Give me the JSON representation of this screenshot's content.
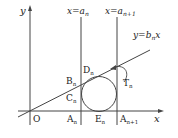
{
  "diagram": {
    "axes": {
      "x_label": "x",
      "y_label": "y",
      "origin_label": "O"
    },
    "lines": [
      {
        "label": "x=a",
        "sub": "n"
      },
      {
        "label": "x=a",
        "sub": "n+1"
      },
      {
        "label": "y=b",
        "sub": "n",
        "tail": "x"
      }
    ],
    "points": [
      {
        "name": "A",
        "sub": "n"
      },
      {
        "name": "E",
        "sub": "n"
      },
      {
        "name": "A",
        "sub": "n+1"
      },
      {
        "name": "B",
        "sub": "n"
      },
      {
        "name": "C",
        "sub": "n"
      },
      {
        "name": "D",
        "sub": "n"
      },
      {
        "name": "T",
        "sub": "n"
      }
    ],
    "colors": {
      "stroke": "#333333",
      "background": "#ffffff"
    }
  }
}
